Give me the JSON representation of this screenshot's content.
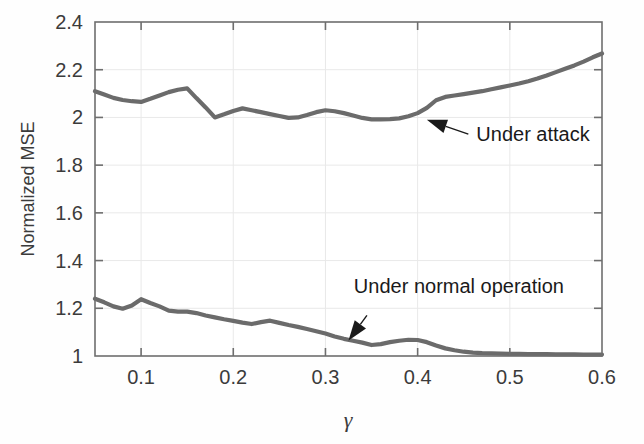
{
  "figure": {
    "background": "#fefefe",
    "plot_frame_color": "#6e6e6e",
    "grid_color": "#e9e9e9",
    "series_color": "#6b6b6b",
    "annotation_color": "#1a1a1a"
  },
  "axes": {
    "ylabel": "Normalized MSE",
    "xlabel": "γ",
    "y_ticks": [
      "1",
      "1.2",
      "1.4",
      "1.6",
      "1.8",
      "2",
      "2.2",
      "2.4"
    ],
    "x_ticks": [
      "0.1",
      "0.2",
      "0.3",
      "0.4",
      "0.5",
      "0.6"
    ]
  },
  "annotations": {
    "attack": "Under attack",
    "normal": "Under normal operation"
  },
  "chart_data": {
    "type": "line",
    "title": "",
    "xlabel": "γ",
    "ylabel": "Normalized MSE",
    "xlim": [
      0.05,
      0.6
    ],
    "ylim": [
      1.0,
      2.4
    ],
    "y_ticks": [
      1.0,
      1.2,
      1.4,
      1.6,
      1.8,
      2.0,
      2.2,
      2.4
    ],
    "x_ticks": [
      0.1,
      0.2,
      0.3,
      0.4,
      0.5,
      0.6
    ],
    "grid": true,
    "legend": "none",
    "annotations": [
      {
        "text": "Under attack",
        "points_to": [
          0.41,
          1.99
        ],
        "label_at": [
          0.455,
          1.93
        ]
      },
      {
        "text": "Under normal operation",
        "points_to": [
          0.325,
          1.065
        ],
        "label_at": [
          0.345,
          1.17
        ]
      }
    ],
    "x": [
      0.05,
      0.06,
      0.07,
      0.08,
      0.09,
      0.1,
      0.11,
      0.12,
      0.13,
      0.14,
      0.15,
      0.16,
      0.17,
      0.18,
      0.19,
      0.2,
      0.21,
      0.22,
      0.23,
      0.24,
      0.25,
      0.26,
      0.27,
      0.28,
      0.29,
      0.3,
      0.31,
      0.32,
      0.33,
      0.34,
      0.35,
      0.36,
      0.37,
      0.38,
      0.39,
      0.4,
      0.41,
      0.42,
      0.43,
      0.44,
      0.45,
      0.46,
      0.47,
      0.48,
      0.49,
      0.5,
      0.51,
      0.52,
      0.53,
      0.54,
      0.55,
      0.56,
      0.57,
      0.58,
      0.59,
      0.6
    ],
    "series": [
      {
        "name": "Under attack",
        "values": [
          2.11,
          2.096,
          2.082,
          2.073,
          2.068,
          2.065,
          2.078,
          2.092,
          2.106,
          2.116,
          2.122,
          2.081,
          2.042,
          2.0,
          2.013,
          2.027,
          2.038,
          2.03,
          2.022,
          2.014,
          2.006,
          1.998,
          2.0,
          2.01,
          2.022,
          2.03,
          2.026,
          2.018,
          2.008,
          1.998,
          1.992,
          1.992,
          1.993,
          1.996,
          2.005,
          2.018,
          2.04,
          2.072,
          2.086,
          2.092,
          2.098,
          2.104,
          2.11,
          2.118,
          2.126,
          2.134,
          2.142,
          2.152,
          2.163,
          2.176,
          2.19,
          2.204,
          2.218,
          2.234,
          2.252,
          2.268
        ]
      },
      {
        "name": "Under normal operation",
        "values": [
          1.24,
          1.225,
          1.208,
          1.198,
          1.212,
          1.238,
          1.222,
          1.208,
          1.19,
          1.186,
          1.186,
          1.18,
          1.17,
          1.162,
          1.154,
          1.147,
          1.14,
          1.134,
          1.142,
          1.148,
          1.139,
          1.13,
          1.122,
          1.113,
          1.104,
          1.094,
          1.082,
          1.072,
          1.064,
          1.056,
          1.046,
          1.05,
          1.058,
          1.064,
          1.068,
          1.067,
          1.058,
          1.044,
          1.032,
          1.024,
          1.018,
          1.014,
          1.012,
          1.011,
          1.01,
          1.009,
          1.009,
          1.008,
          1.008,
          1.008,
          1.007,
          1.007,
          1.007,
          1.006,
          1.006,
          1.006
        ]
      }
    ]
  }
}
